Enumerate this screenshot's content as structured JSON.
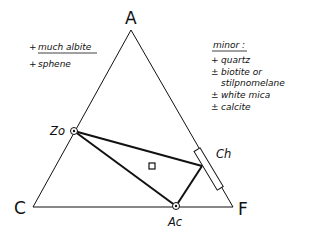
{
  "diagram": {
    "type": "ACF ternary phase diagram",
    "vertices": {
      "top": {
        "label": "A"
      },
      "left": {
        "label": "C"
      },
      "right": {
        "label": "F"
      }
    },
    "phases": {
      "zo": {
        "label": "Zo"
      },
      "ac": {
        "label": "Ac"
      },
      "ch": {
        "label": "Ch"
      }
    },
    "left_notes": [
      {
        "prefix": "+",
        "text": "much albite",
        "underlined": true
      },
      {
        "prefix": "+",
        "text": "sphene",
        "underlined": false
      }
    ],
    "right_notes": {
      "heading": "minor :",
      "items": [
        {
          "prefix": "+",
          "text": "quartz"
        },
        {
          "prefix": "±",
          "text": "biotite or"
        },
        {
          "prefix": "",
          "text": "stilpnomelane"
        },
        {
          "prefix": "±",
          "text": "white mica"
        },
        {
          "prefix": "±",
          "text": "calcite"
        }
      ]
    },
    "colors": {
      "line": "#111111",
      "background": "#ffffff"
    }
  }
}
